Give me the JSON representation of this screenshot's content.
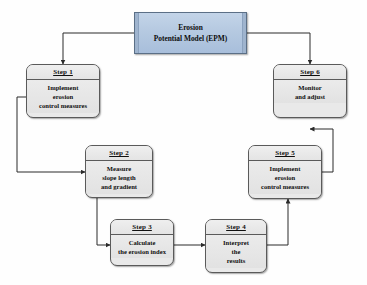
{
  "diagram": {
    "title_box": {
      "name": "erosion-potential-model",
      "line1": "Erosion",
      "line2": "Potential Model (EPM)",
      "fill_color": "#b4c8e0",
      "border_color": "#5b6f86"
    },
    "node_fill_color": "#e9e9e9",
    "node_border_color": "#5a5a5a",
    "connector_color": "#2b2b2b",
    "steps": [
      {
        "id": "step1",
        "header": "Step 1",
        "lines": [
          "Implement",
          "erosion",
          "control measures"
        ]
      },
      {
        "id": "step2",
        "header": "Step 2",
        "lines": [
          "Measure",
          "slope length",
          "and gradient"
        ]
      },
      {
        "id": "step3",
        "header": "Step 3",
        "lines": [
          "Calculate",
          "the erosion index"
        ]
      },
      {
        "id": "step4",
        "header": "Step 4",
        "lines": [
          "Interpret",
          "the",
          "results"
        ]
      },
      {
        "id": "step5",
        "header": "Step 5",
        "lines": [
          "Implement",
          "erosion",
          "control measures"
        ]
      },
      {
        "id": "step6",
        "header": "Step 6",
        "lines": [
          "Monitor",
          "and adjust"
        ]
      }
    ],
    "flow": [
      {
        "from": "erosion-potential-model",
        "to": "step1"
      },
      {
        "from": "erosion-potential-model",
        "to": "step6"
      },
      {
        "from": "step1",
        "to": "step2"
      },
      {
        "from": "step2",
        "to": "step3"
      },
      {
        "from": "step3",
        "to": "step4"
      },
      {
        "from": "step4",
        "to": "step5"
      },
      {
        "from": "step5",
        "to": "step6"
      }
    ]
  }
}
